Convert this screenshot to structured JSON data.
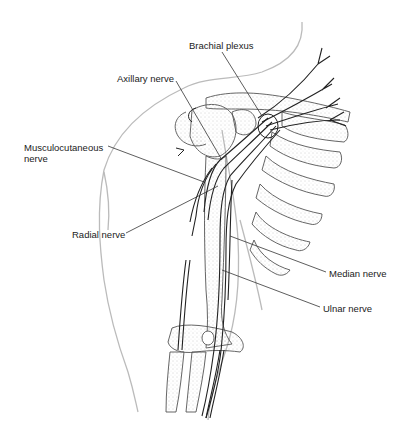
{
  "diagram": {
    "colors": {
      "outline": "#b8b8b8",
      "bone": "#555555",
      "nerve": "#222222",
      "leader": "#333333",
      "stipple": "#9a9a9a",
      "text": "#222222"
    },
    "labels": [
      {
        "id": "brachial-plexus",
        "text": "Brachial plexus",
        "x": 189,
        "y": 40
      },
      {
        "id": "axillary-nerve",
        "text": "Axillary nerve",
        "x": 117,
        "y": 73
      },
      {
        "id": "musculocutaneous-nerve-line1",
        "text": "Musculocutaneous",
        "x": 24,
        "y": 142
      },
      {
        "id": "musculocutaneous-nerve-line2",
        "text": "nerve",
        "x": 24,
        "y": 153
      },
      {
        "id": "radial-nerve",
        "text": "Radial nerve",
        "x": 72,
        "y": 229
      },
      {
        "id": "median-nerve",
        "text": "Median nerve",
        "x": 329,
        "y": 268
      },
      {
        "id": "ulnar-nerve",
        "text": "Ulnar nerve",
        "x": 323,
        "y": 303
      }
    ]
  }
}
